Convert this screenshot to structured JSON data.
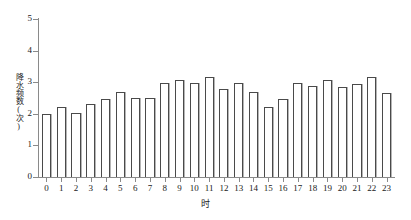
{
  "chart_data": {
    "type": "bar",
    "title": "",
    "subtitle": "",
    "xlabel": "时",
    "ylabel": "降水频数(次)",
    "categories": [
      "0",
      "1",
      "2",
      "3",
      "4",
      "5",
      "6",
      "7",
      "8",
      "9",
      "10",
      "11",
      "12",
      "13",
      "14",
      "15",
      "16",
      "17",
      "18",
      "19",
      "20",
      "21",
      "22",
      "23"
    ],
    "values": [
      2.0,
      2.2,
      2.02,
      2.3,
      2.48,
      2.7,
      2.5,
      2.5,
      2.97,
      3.07,
      2.97,
      3.17,
      2.79,
      2.97,
      2.68,
      2.2,
      2.48,
      2.97,
      2.87,
      3.07,
      2.86,
      2.95,
      3.15,
      2.66
    ],
    "ylim": [
      0,
      5
    ],
    "yticks": [
      0,
      1,
      2,
      3,
      4,
      5
    ],
    "ytick_labels": [
      "0",
      "1",
      "2",
      "3",
      "4",
      "5"
    ],
    "xtick_labels": [
      "0",
      "1",
      "2",
      "3",
      "4",
      "5",
      "6",
      "7",
      "8",
      "9",
      "10",
      "11",
      "12",
      "13",
      "14",
      "15",
      "16",
      "17",
      "18",
      "19",
      "20",
      "21",
      "22",
      "23"
    ],
    "grid": false,
    "legend": null,
    "legend_position": "none",
    "bar_face_color": "#ffffff",
    "bar_edge_color": "#4a4a4a",
    "axis_color": "#8a8a8a",
    "background_color": "#ffffff"
  }
}
